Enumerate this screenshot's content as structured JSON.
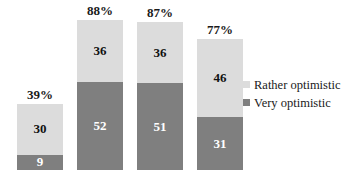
{
  "chart_data": {
    "type": "bar",
    "subtype": "stacked-bar",
    "title": "",
    "subtitle": "",
    "xlabel": "",
    "ylabel": "",
    "grid": false,
    "axis_visible": false,
    "ylim": [
      0,
      100
    ],
    "legend_position": "right",
    "value_unit": "percent",
    "categories": [
      "1",
      "2",
      "3",
      "4"
    ],
    "series": [
      {
        "name": "Very optimistic",
        "color": "#7f7f7f",
        "values": [
          9,
          52,
          51,
          31
        ]
      },
      {
        "name": "Rather optimistic",
        "color": "#dcdcdc",
        "values": [
          30,
          36,
          36,
          46
        ]
      }
    ],
    "totals": [
      39,
      88,
      87,
      77
    ],
    "total_labels": [
      "39%",
      "88%",
      "87%",
      "77%"
    ],
    "bars": [
      {
        "total_label": "39%",
        "total": 39,
        "segments": [
          {
            "label": "30",
            "value": 30,
            "series": "Rather optimistic",
            "tone": "light"
          },
          {
            "label": "9",
            "value": 9,
            "series": "Very optimistic",
            "tone": "dark"
          }
        ]
      },
      {
        "total_label": "88%",
        "total": 88,
        "segments": [
          {
            "label": "36",
            "value": 36,
            "series": "Rather optimistic",
            "tone": "light"
          },
          {
            "label": "52",
            "value": 52,
            "series": "Very optimistic",
            "tone": "dark"
          }
        ]
      },
      {
        "total_label": "87%",
        "total": 87,
        "segments": [
          {
            "label": "36",
            "value": 36,
            "series": "Rather optimistic",
            "tone": "light"
          },
          {
            "label": "51",
            "value": 51,
            "series": "Very optimistic",
            "tone": "dark"
          }
        ]
      },
      {
        "total_label": "77%",
        "total": 77,
        "segments": [
          {
            "label": "46",
            "value": 46,
            "series": "Rather optimistic",
            "tone": "light"
          },
          {
            "label": "31",
            "value": 31,
            "series": "Very optimistic",
            "tone": "dark"
          }
        ]
      }
    ]
  },
  "legend": {
    "items": [
      {
        "label": "Rather optimistic",
        "tone": "light"
      },
      {
        "label": "Very optimistic",
        "tone": "dark"
      }
    ]
  },
  "colors": {
    "light": "#dcdcdc",
    "dark": "#7f7f7f",
    "background": "#ffffff",
    "text": "#1a1a1a",
    "text_on_dark": "#ffffff"
  },
  "layout": {
    "bar_width_px": 46,
    "bar_gap_px": 14,
    "plot_left_px": 17,
    "baseline_bottom_px": 7,
    "px_per_percent": 1.7
  }
}
